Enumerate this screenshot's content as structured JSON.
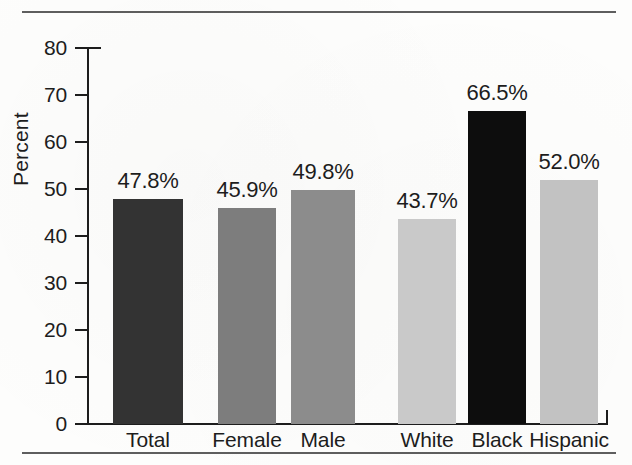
{
  "figure": {
    "background_color": "#fdfdfc",
    "rule_color": "#5e5e5e",
    "axis_color": "#1d1d1d"
  },
  "chart_data": {
    "type": "bar",
    "title": "",
    "subtitle": "",
    "xlabel": "",
    "ylabel": "Percent",
    "ylim": [
      0,
      80
    ],
    "yticks": [
      0,
      10,
      20,
      30,
      40,
      50,
      60,
      70,
      80
    ],
    "ytick_labels": [
      "0",
      "10",
      "20",
      "30",
      "40",
      "50",
      "60",
      "70",
      "80"
    ],
    "grid": false,
    "legend": false,
    "legend_position": "none",
    "value_label_suffix": "%",
    "categories": [
      "Total",
      "Female",
      "Male",
      "White",
      "Black",
      "Hispanic"
    ],
    "values": [
      47.8,
      45.9,
      49.8,
      43.7,
      66.5,
      52.0
    ],
    "value_labels": [
      "47.8%",
      "45.9%",
      "49.8%",
      "43.7%",
      "66.5%",
      "52.0%"
    ],
    "bar_colors": [
      "#333333",
      "#7d7d7d",
      "#8c8c8c",
      "#c9c9c9",
      "#0d0d0d",
      "#c2c2c2"
    ],
    "groups": [
      {
        "name": "overall",
        "categories": [
          "Total"
        ]
      },
      {
        "name": "sex",
        "categories": [
          "Female",
          "Male"
        ]
      },
      {
        "name": "race-ethnicity",
        "categories": [
          "White",
          "Black",
          "Hispanic"
        ]
      }
    ]
  },
  "geometry": {
    "baseline_y": 424,
    "top_y": 48,
    "axis_x": 88,
    "plot_right_x": 608,
    "bars": [
      {
        "left": 113,
        "width": 70
      },
      {
        "left": 218,
        "width": 58
      },
      {
        "left": 291,
        "width": 64
      },
      {
        "left": 398,
        "width": 58
      },
      {
        "left": 468,
        "width": 58
      },
      {
        "left": 540,
        "width": 58
      }
    ]
  }
}
